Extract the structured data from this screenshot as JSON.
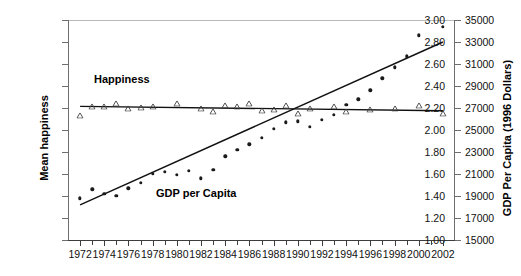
{
  "chart_data": {
    "type": "scatter",
    "title": "",
    "xlabel": "",
    "ylabel": "Mean happiness",
    "y2label": "GDP Per Capita (1996 Dollars)",
    "grid": false,
    "legend_position": "inline-annotations",
    "xlim": [
      1971,
      2003
    ],
    "ylim": [
      1.0,
      3.0
    ],
    "y2lim": [
      15000,
      35000
    ],
    "x_tick_step": 1,
    "x_label_step": 2,
    "x": [
      1972,
      1973,
      1974,
      1975,
      1976,
      1977,
      1978,
      1979,
      1980,
      1981,
      1982,
      1983,
      1984,
      1985,
      1986,
      1987,
      1988,
      1989,
      1990,
      1991,
      1992,
      1993,
      1994,
      1995,
      1996,
      1997,
      1998,
      1999,
      2000,
      2001,
      2002
    ],
    "x_tick_labels": [
      "1972",
      "1974",
      "1976",
      "1978",
      "1980",
      "1982",
      "1984",
      "1986",
      "1988",
      "1990",
      "1992",
      "1994",
      "1996",
      "1998",
      "2000",
      "2002"
    ],
    "y_tick_labels": [
      "1.00",
      "1.20",
      "1.40",
      "1.60",
      "1.80",
      "2.00",
      "2.20",
      "2.40",
      "2.60",
      "2.80",
      "3.00"
    ],
    "y2_tick_labels": [
      "15000",
      "17000",
      "19000",
      "21000",
      "23000",
      "25000",
      "27000",
      "29000",
      "31000",
      "33000",
      "35000"
    ],
    "series": [
      {
        "name": "Happiness",
        "axis": "left",
        "marker": "open-triangle",
        "annotation": "Happiness",
        "x": [
          1972,
          1973,
          1974,
          1975,
          1976,
          1977,
          1978,
          1980,
          1982,
          1983,
          1984,
          1985,
          1986,
          1987,
          1988,
          1989,
          1990,
          1991,
          1993,
          1994,
          1996,
          1998,
          2000,
          2002
        ],
        "values": [
          2.13,
          2.21,
          2.21,
          2.24,
          2.19,
          2.2,
          2.21,
          2.24,
          2.19,
          2.16,
          2.22,
          2.21,
          2.24,
          2.17,
          2.18,
          2.22,
          2.15,
          2.19,
          2.21,
          2.16,
          2.18,
          2.19,
          2.22,
          2.15
        ],
        "trend_start": [
          1972,
          2.215
        ],
        "trend_end": [
          2002,
          2.175
        ]
      },
      {
        "name": "GDP per Capita",
        "axis": "right",
        "marker": "filled-diamond",
        "annotation": "GDP per Capita",
        "x": [
          1972,
          1973,
          1974,
          1975,
          1976,
          1977,
          1978,
          1979,
          1980,
          1981,
          1982,
          1983,
          1984,
          1985,
          1986,
          1987,
          1988,
          1989,
          1990,
          1991,
          1992,
          1993,
          1994,
          1995,
          1996,
          1997,
          1998,
          1999,
          2000,
          2002
        ],
        "values": [
          18800,
          19600,
          19200,
          19000,
          19700,
          20200,
          21000,
          21200,
          20900,
          21300,
          20600,
          21400,
          22600,
          23200,
          23700,
          24300,
          25100,
          25700,
          25800,
          25300,
          25900,
          26400,
          27300,
          27800,
          28600,
          29700,
          30700,
          31700,
          33600,
          34400
        ],
        "trend_start": [
          1972,
          18200
        ],
        "trend_end": [
          2002,
          33000
        ]
      }
    ]
  },
  "annotations": {
    "happiness": "Happiness",
    "gdp": "GDP per Capita"
  },
  "axis_titles": {
    "left": "Mean happiness",
    "right": "GDP Per Capita (1996 Dollars)"
  },
  "colors": {
    "marker": "#1a1a1a",
    "trend": "#111111",
    "axis": "#3d3d3d"
  }
}
